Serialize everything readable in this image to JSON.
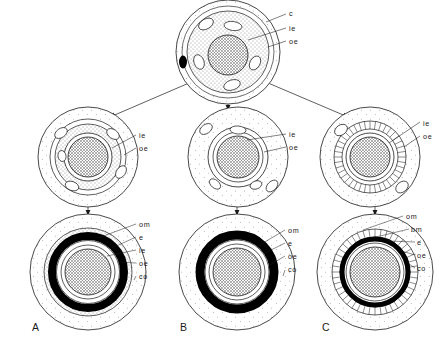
{
  "figure": {
    "background": "#ffffff",
    "stroke_color": "#1a1a1a",
    "fill_stipple": "#fdfdfd",
    "fill_dense_stipple": "#efefef",
    "fill_hatch_core": "#d8d8d8",
    "fill_black_band": "#000000"
  },
  "legend_keys": {
    "c": "c",
    "ie": "ie",
    "oe": "oe",
    "om": "om",
    "bm": "bm",
    "e": "e",
    "co": "co"
  },
  "stages": {
    "top": {
      "id": "top-cell",
      "name": "undifferentiated-cell",
      "cx": 228,
      "cy": 52,
      "r_outer": 52,
      "labels": [
        {
          "key": "c",
          "text": "c",
          "x": 291,
          "y": 16
        },
        {
          "key": "ie",
          "text": "ie",
          "x": 291,
          "y": 30
        },
        {
          "key": "oe",
          "text": "oe",
          "x": 291,
          "y": 43
        }
      ],
      "inclusions": 5,
      "has_dark_granule": true
    },
    "mid_left": {
      "id": "mid-left-cell",
      "name": "intermediate-cell-a",
      "cx": 88,
      "cy": 157,
      "r_outer": 50,
      "labels": [
        {
          "key": "ie",
          "text": "ie",
          "x": 140,
          "y": 138
        },
        {
          "key": "oe",
          "text": "oe",
          "x": 140,
          "y": 151
        }
      ],
      "inclusions": 5,
      "ring_style": "smooth"
    },
    "mid_center": {
      "id": "mid-center-cell",
      "name": "intermediate-cell-b",
      "cx": 238,
      "cy": 157,
      "r_outer": 50,
      "labels": [
        {
          "key": "ie",
          "text": "ie",
          "x": 290,
          "y": 138
        },
        {
          "key": "oe",
          "text": "oe",
          "x": 290,
          "y": 151
        }
      ],
      "inclusions": 5,
      "ring_style": "smooth"
    },
    "mid_right": {
      "id": "mid-right-cell",
      "name": "intermediate-cell-c",
      "cx": 370,
      "cy": 157,
      "r_outer": 50,
      "labels": [
        {
          "key": "ie",
          "text": "ie",
          "x": 424,
          "y": 126
        },
        {
          "key": "oe",
          "text": "oe",
          "x": 424,
          "y": 139
        }
      ],
      "inclusions": 2,
      "ring_style": "radial-striped",
      "radial_spokes": 40
    },
    "panel_a": {
      "id": "panel-a",
      "name": "mature-form-a",
      "letter": "A",
      "letter_x": 32,
      "letter_y": 331,
      "cx": 88,
      "cy": 272,
      "r_outer": 58,
      "labels": [
        {
          "key": "om",
          "text": "om",
          "x": 139,
          "y": 227
        },
        {
          "key": "e",
          "text": "e",
          "x": 139,
          "y": 240
        },
        {
          "key": "ie",
          "text": "ie",
          "x": 139,
          "y": 253
        },
        {
          "key": "oe",
          "text": "oe",
          "x": 139,
          "y": 266
        },
        {
          "key": "co",
          "text": "co",
          "x": 139,
          "y": 279
        }
      ],
      "has_inner_extra_ring": true
    },
    "panel_b": {
      "id": "panel-b",
      "name": "mature-form-b",
      "letter": "B",
      "letter_x": 180,
      "letter_y": 331,
      "cx": 237,
      "cy": 272,
      "r_outer": 58,
      "labels": [
        {
          "key": "om",
          "text": "om",
          "x": 288,
          "y": 233
        },
        {
          "key": "e",
          "text": "e",
          "x": 288,
          "y": 246
        },
        {
          "key": "oe",
          "text": "oe",
          "x": 288,
          "y": 259
        },
        {
          "key": "co",
          "text": "co",
          "x": 288,
          "y": 272
        }
      ],
      "has_inner_extra_ring": false
    },
    "panel_c": {
      "id": "panel-c",
      "name": "mature-form-c",
      "letter": "C",
      "letter_x": 322,
      "letter_y": 331,
      "cx": 375,
      "cy": 272,
      "r_outer": 58,
      "labels": [
        {
          "key": "om",
          "text": "om",
          "x": 406,
          "y": 219
        },
        {
          "key": "bm",
          "text": "bm",
          "x": 412,
          "y": 232
        },
        {
          "key": "e",
          "text": "e",
          "x": 418,
          "y": 245
        },
        {
          "key": "oe",
          "text": "oe",
          "x": 418,
          "y": 258
        },
        {
          "key": "co",
          "text": "co",
          "x": 418,
          "y": 271
        }
      ],
      "has_radial_mantle": true,
      "radial_spokes": 44
    }
  },
  "arrows": {
    "branch_left": {
      "name": "arrow-top-to-mid-left",
      "x1": 196,
      "y1": 78,
      "x2": 108,
      "y2": 118
    },
    "branch_center": {
      "name": "arrow-top-to-mid-center",
      "x1": 228,
      "y1": 105,
      "x2": 228,
      "y2": 112
    },
    "branch_right": {
      "name": "arrow-top-to-mid-right",
      "x1": 262,
      "y1": 78,
      "x2": 350,
      "y2": 118
    },
    "down_left": {
      "name": "arrow-mid-left-to-panel-a",
      "x1": 88,
      "y1": 205,
      "x2": 88,
      "y2": 216
    },
    "down_center": {
      "name": "arrow-mid-center-to-panel-b",
      "x1": 237,
      "y1": 205,
      "x2": 237,
      "y2": 216
    },
    "down_right": {
      "name": "arrow-mid-right-to-panel-c",
      "x1": 375,
      "y1": 205,
      "x2": 375,
      "y2": 216
    }
  }
}
